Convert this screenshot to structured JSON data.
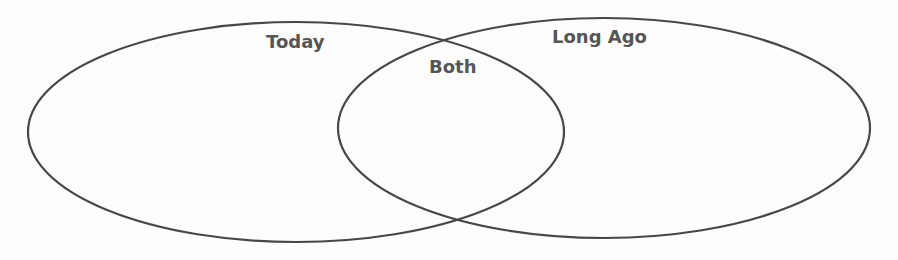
{
  "diagram": {
    "type": "venn",
    "sets": [
      {
        "id": "today",
        "label": "Today",
        "ellipse": {
          "cx": 296,
          "cy": 132,
          "rx": 268,
          "ry": 110
        }
      },
      {
        "id": "long_ago",
        "label": "Long Ago",
        "ellipse": {
          "cx": 604,
          "cy": 128,
          "rx": 266,
          "ry": 110
        }
      }
    ],
    "intersection": {
      "label": "Both"
    },
    "colors": {
      "stroke": "#474747",
      "text": "#555555",
      "background": "#fdfdfd"
    }
  }
}
